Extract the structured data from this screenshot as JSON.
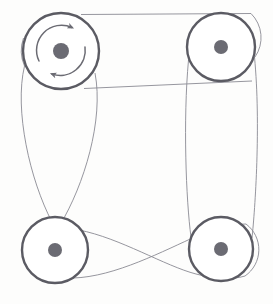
{
  "document": {
    "title": "Belt and pulley system diagram",
    "caption": "",
    "background_color": "#fdfdfc"
  },
  "figure": {
    "type": "mechanical-schematic",
    "name": "four-pulley-belt-drive",
    "width": 273,
    "height": 304,
    "colors": {
      "pulley_rim": "#5b5b63",
      "pulley_face": "#ffffff",
      "hub": "#6b6b73",
      "belt": "#8a8a93",
      "arrow": "#6b6b73",
      "caption_text": "#bdbdbd"
    },
    "stroke_widths": {
      "pulley_rim": 2.4,
      "belt": 0.9,
      "arrow": 1.4
    }
  },
  "pulleys": [
    {
      "id": "pulley-top-left",
      "label": "Top left pulley",
      "cx": 61,
      "cy": 51,
      "radius": 38,
      "hub_radius": 8,
      "has_rotation_arrow": true,
      "rotation_direction": "clockwise"
    },
    {
      "id": "pulley-top-right",
      "label": "Top right pulley",
      "cx": 221,
      "cy": 47,
      "radius": 34,
      "hub_radius": 7,
      "has_rotation_arrow": false,
      "rotation_direction": ""
    },
    {
      "id": "pulley-bottom-left",
      "label": "Bottom left pulley",
      "cx": 55,
      "cy": 250,
      "radius": 33,
      "hub_radius": 7,
      "has_rotation_arrow": false,
      "rotation_direction": ""
    },
    {
      "id": "pulley-bottom-right",
      "label": "Bottom right pulley",
      "cx": 221,
      "cy": 249,
      "radius": 32,
      "hub_radius": 7,
      "has_rotation_arrow": false,
      "rotation_direction": ""
    }
  ],
  "belts": [
    {
      "id": "belt-top-open",
      "label": "Open belt between top pulleys",
      "crossed": false,
      "path": "M 82 15 L 250 14 M 84 88 L 250 81"
    },
    {
      "id": "belt-left-crossed",
      "label": "Crossed belt between left pulleys",
      "crossed": true,
      "path": "M 24 64 C 12 130 22 200 27 222 M 94 70 C 100 140 86 215 84 240"
    },
    {
      "id": "belt-right-open",
      "label": "Open belt between right pulleys",
      "crossed": false,
      "path": "M 188 62 C 183 140 188 210 190 230 M 255 58 C 260 140 254 212 252 232"
    },
    {
      "id": "belt-bottom-crossed",
      "label": "Crossed belt between bottom pulleys",
      "crossed": true,
      "path": "M 80 232 C 130 245 170 268 251 272 M 79 271 C 130 268 170 240 250 228"
    }
  ],
  "rotation_arrow": {
    "id": "rotation-arrow-top-left",
    "label": "Rotation direction arrow",
    "direction": "clockwise",
    "radius": 25,
    "center_x": 61,
    "center_y": 51
  }
}
